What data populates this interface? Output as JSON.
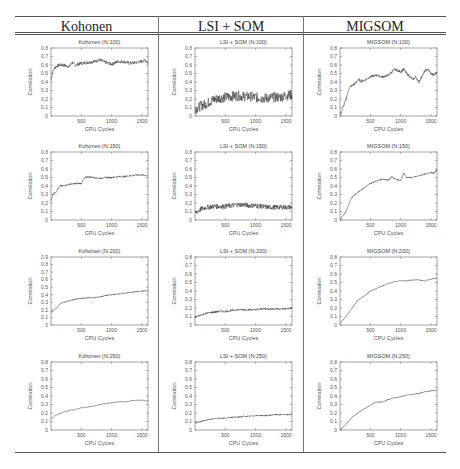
{
  "table": {
    "headers": [
      "Kohonen",
      "LSI + SOM",
      "MIGSOM"
    ]
  },
  "chart_data": [
    {
      "type": "line",
      "title": "Kohonen (N:100)",
      "xlabel": "CPU Cycles",
      "ylabel": "Correlation",
      "xlim": [
        0,
        1600
      ],
      "ylim": [
        0,
        0.8
      ],
      "xticks": [
        500,
        1000,
        1500
      ],
      "yticks": [
        0,
        0.1,
        0.2,
        0.3,
        0.4,
        0.5,
        0.6,
        0.7,
        0.8
      ],
      "noise": 0.02,
      "x": [
        0,
        20,
        50,
        100,
        150,
        200,
        300,
        350,
        400,
        500,
        600,
        700,
        800,
        900,
        1000,
        1100,
        1200,
        1300,
        1400,
        1500,
        1550,
        1600
      ],
      "y": [
        0.42,
        0.5,
        0.56,
        0.59,
        0.6,
        0.6,
        0.58,
        0.63,
        0.6,
        0.62,
        0.63,
        0.64,
        0.66,
        0.63,
        0.61,
        0.64,
        0.64,
        0.62,
        0.63,
        0.64,
        0.66,
        0.63
      ]
    },
    {
      "type": "line",
      "title": "LSI + SOM (N:100)",
      "xlabel": "CPU Cycles",
      "ylabel": "Correlation",
      "xlim": [
        0,
        1600
      ],
      "ylim": [
        0,
        0.8
      ],
      "xticks": [
        500,
        1000,
        1500
      ],
      "yticks": [
        0,
        0.1,
        0.2,
        0.3,
        0.4,
        0.5,
        0.6,
        0.7,
        0.8
      ],
      "noise": 0.06,
      "x": [
        0,
        100,
        200,
        300,
        400,
        500,
        600,
        700,
        800,
        900,
        1000,
        1100,
        1200,
        1300,
        1400,
        1500,
        1600
      ],
      "y": [
        0.08,
        0.12,
        0.15,
        0.19,
        0.21,
        0.22,
        0.23,
        0.24,
        0.23,
        0.23,
        0.22,
        0.21,
        0.21,
        0.22,
        0.22,
        0.24,
        0.25
      ]
    },
    {
      "type": "line",
      "title": "MIGSOM (N:100)",
      "xlabel": "CPU Cycles",
      "ylabel": "Correlation",
      "xlim": [
        0,
        1600
      ],
      "ylim": [
        0,
        0.8
      ],
      "xticks": [
        500,
        1000,
        1500
      ],
      "yticks": [
        0,
        0.1,
        0.2,
        0.3,
        0.4,
        0.5,
        0.6,
        0.7,
        0.8
      ],
      "noise": 0.015,
      "x": [
        0,
        50,
        100,
        150,
        200,
        250,
        300,
        350,
        400,
        500,
        600,
        700,
        800,
        900,
        1000,
        1050,
        1100,
        1200,
        1250,
        1300,
        1400,
        1450,
        1500,
        1550,
        1600
      ],
      "y": [
        0.0,
        0.1,
        0.2,
        0.33,
        0.36,
        0.38,
        0.43,
        0.41,
        0.42,
        0.46,
        0.48,
        0.46,
        0.48,
        0.55,
        0.52,
        0.55,
        0.5,
        0.43,
        0.46,
        0.4,
        0.53,
        0.55,
        0.5,
        0.48,
        0.52
      ]
    },
    {
      "type": "line",
      "title": "Kohonen (N:150)",
      "xlabel": "CPU Cycles",
      "ylabel": "Correlation",
      "xlim": [
        0,
        1600
      ],
      "ylim": [
        0,
        0.8
      ],
      "xticks": [
        500,
        1000,
        1500
      ],
      "yticks": [
        0,
        0.1,
        0.2,
        0.3,
        0.4,
        0.5,
        0.6,
        0.7,
        0.8
      ],
      "noise": 0.01,
      "x": [
        0,
        30,
        80,
        150,
        200,
        300,
        400,
        500,
        550,
        600,
        700,
        800,
        900,
        1000,
        1100,
        1200,
        1300,
        1400,
        1500,
        1600
      ],
      "y": [
        0.22,
        0.3,
        0.33,
        0.4,
        0.4,
        0.42,
        0.43,
        0.43,
        0.49,
        0.51,
        0.5,
        0.49,
        0.5,
        0.5,
        0.51,
        0.51,
        0.52,
        0.53,
        0.53,
        0.52
      ]
    },
    {
      "type": "line",
      "title": "LSI + SOM (N:150)",
      "xlabel": "CPU Cycles",
      "ylabel": "Correlation",
      "xlim": [
        0,
        1600
      ],
      "ylim": [
        0,
        0.8
      ],
      "xticks": [
        500,
        1000,
        1500
      ],
      "yticks": [
        0,
        0.1,
        0.2,
        0.3,
        0.4,
        0.5,
        0.6,
        0.7,
        0.8
      ],
      "noise": 0.03,
      "x": [
        0,
        100,
        200,
        300,
        400,
        500,
        600,
        700,
        800,
        900,
        1000,
        1100,
        1200,
        1300,
        1400,
        1500,
        1600
      ],
      "y": [
        0.08,
        0.13,
        0.15,
        0.16,
        0.16,
        0.16,
        0.17,
        0.18,
        0.18,
        0.17,
        0.17,
        0.16,
        0.15,
        0.15,
        0.15,
        0.15,
        0.15
      ]
    },
    {
      "type": "line",
      "title": "MIGSOM (N:150)",
      "xlabel": "CPU Cycles",
      "ylabel": "Correlation",
      "xlim": [
        0,
        1600
      ],
      "ylim": [
        0,
        0.8
      ],
      "xticks": [
        500,
        1000,
        1500
      ],
      "yticks": [
        0,
        0.1,
        0.2,
        0.3,
        0.4,
        0.5,
        0.6,
        0.7,
        0.8
      ],
      "noise": 0.008,
      "x": [
        0,
        100,
        150,
        200,
        300,
        400,
        500,
        600,
        700,
        800,
        850,
        900,
        1000,
        1050,
        1100,
        1200,
        1300,
        1400,
        1500,
        1550,
        1600
      ],
      "y": [
        0.0,
        0.1,
        0.2,
        0.27,
        0.33,
        0.38,
        0.43,
        0.46,
        0.48,
        0.47,
        0.51,
        0.49,
        0.46,
        0.55,
        0.5,
        0.5,
        0.52,
        0.54,
        0.56,
        0.55,
        0.59
      ]
    },
    {
      "type": "line",
      "title": "Kohonen (N:200)",
      "xlabel": "CPU Cycles",
      "ylabel": "Correlation",
      "xlim": [
        0,
        1600
      ],
      "ylim": [
        0,
        0.9
      ],
      "xticks": [
        500,
        1000,
        1500
      ],
      "yticks": [
        0,
        0.1,
        0.2,
        0.3,
        0.4,
        0.5,
        0.6,
        0.7,
        0.8,
        0.9
      ],
      "noise": 0.008,
      "x": [
        0,
        50,
        100,
        150,
        200,
        300,
        400,
        500,
        600,
        700,
        800,
        900,
        1000,
        1100,
        1200,
        1300,
        1400,
        1500,
        1600
      ],
      "y": [
        0.17,
        0.2,
        0.23,
        0.28,
        0.3,
        0.32,
        0.34,
        0.35,
        0.36,
        0.36,
        0.37,
        0.39,
        0.4,
        0.41,
        0.42,
        0.43,
        0.44,
        0.45,
        0.45
      ]
    },
    {
      "type": "line",
      "title": "LSI + SOM (N:200)",
      "xlabel": "CPU Cycles",
      "ylabel": "Correlation",
      "xlim": [
        0,
        1600
      ],
      "ylim": [
        0,
        0.8
      ],
      "xticks": [
        500,
        1000,
        1500
      ],
      "yticks": [
        0,
        0.1,
        0.2,
        0.3,
        0.4,
        0.5,
        0.6,
        0.7,
        0.8
      ],
      "noise": 0.012,
      "x": [
        0,
        100,
        200,
        300,
        400,
        500,
        600,
        700,
        800,
        900,
        1000,
        1100,
        1200,
        1300,
        1400,
        1500,
        1600
      ],
      "y": [
        0.09,
        0.12,
        0.14,
        0.15,
        0.16,
        0.16,
        0.17,
        0.18,
        0.18,
        0.18,
        0.18,
        0.19,
        0.19,
        0.19,
        0.19,
        0.19,
        0.2
      ]
    },
    {
      "type": "line",
      "title": "MIGSOM (N:200)",
      "xlabel": "CPU Cycles",
      "ylabel": "Correlation",
      "xlim": [
        0,
        1600
      ],
      "ylim": [
        0,
        0.8
      ],
      "xticks": [
        500,
        1000,
        1500
      ],
      "yticks": [
        0,
        0.1,
        0.2,
        0.3,
        0.4,
        0.5,
        0.6,
        0.7,
        0.8
      ],
      "noise": 0.005,
      "x": [
        0,
        100,
        200,
        300,
        400,
        500,
        600,
        700,
        800,
        900,
        1000,
        1100,
        1200,
        1300,
        1400,
        1500,
        1600
      ],
      "y": [
        0.02,
        0.1,
        0.2,
        0.29,
        0.34,
        0.4,
        0.43,
        0.46,
        0.49,
        0.51,
        0.52,
        0.52,
        0.53,
        0.53,
        0.52,
        0.54,
        0.55
      ]
    },
    {
      "type": "line",
      "title": "Kohonen (N:250)",
      "xlabel": "CPU Cycles",
      "ylabel": "Correlation",
      "xlim": [
        0,
        1600
      ],
      "ylim": [
        0,
        0.8
      ],
      "xticks": [
        500,
        1000,
        1500
      ],
      "yticks": [
        0,
        0.1,
        0.2,
        0.3,
        0.4,
        0.5,
        0.6,
        0.7,
        0.8
      ],
      "noise": 0.004,
      "x": [
        0,
        50,
        100,
        200,
        300,
        400,
        500,
        600,
        700,
        800,
        900,
        1000,
        1100,
        1200,
        1300,
        1400,
        1500,
        1600
      ],
      "y": [
        0.13,
        0.16,
        0.18,
        0.21,
        0.23,
        0.24,
        0.26,
        0.27,
        0.28,
        0.3,
        0.31,
        0.32,
        0.33,
        0.33,
        0.34,
        0.35,
        0.35,
        0.34
      ]
    },
    {
      "type": "line",
      "title": "LSI + SOM (N:250)",
      "xlabel": "CPU Cycles",
      "ylabel": "Correlation",
      "xlim": [
        0,
        1600
      ],
      "ylim": [
        0,
        0.8
      ],
      "xticks": [
        500,
        1000,
        1500
      ],
      "yticks": [
        0,
        0.1,
        0.2,
        0.3,
        0.4,
        0.5,
        0.6,
        0.7,
        0.8
      ],
      "noise": 0.008,
      "x": [
        0,
        100,
        200,
        300,
        400,
        500,
        600,
        700,
        800,
        900,
        1000,
        1100,
        1200,
        1300,
        1400,
        1500,
        1600
      ],
      "y": [
        0.08,
        0.1,
        0.12,
        0.13,
        0.14,
        0.14,
        0.15,
        0.15,
        0.16,
        0.16,
        0.17,
        0.17,
        0.17,
        0.18,
        0.18,
        0.18,
        0.18
      ]
    },
    {
      "type": "line",
      "title": "MIGSOM (N:250)",
      "xlabel": "CPU Cycles",
      "ylabel": "Correlation",
      "xlim": [
        0,
        1600
      ],
      "ylim": [
        0,
        0.8
      ],
      "xticks": [
        500,
        1000,
        1500
      ],
      "yticks": [
        0,
        0.1,
        0.2,
        0.3,
        0.4,
        0.5,
        0.6,
        0.7,
        0.8
      ],
      "noise": 0.005,
      "x": [
        0,
        100,
        200,
        300,
        400,
        500,
        600,
        700,
        800,
        900,
        1000,
        1100,
        1200,
        1300,
        1400,
        1500,
        1600
      ],
      "y": [
        0.0,
        0.07,
        0.15,
        0.2,
        0.25,
        0.29,
        0.33,
        0.33,
        0.36,
        0.38,
        0.39,
        0.41,
        0.42,
        0.43,
        0.45,
        0.46,
        0.47
      ]
    }
  ]
}
